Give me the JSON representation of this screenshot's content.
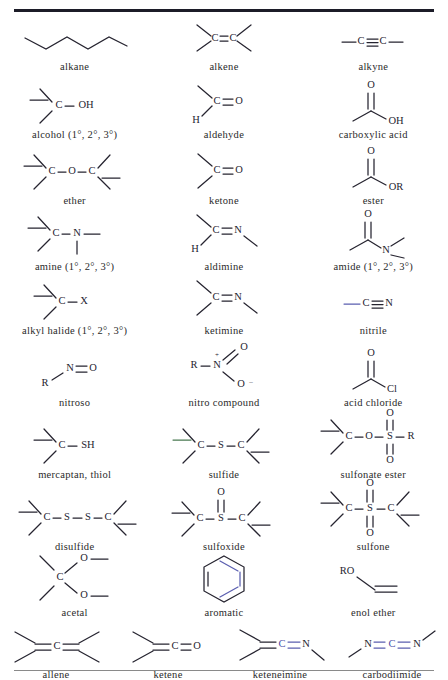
{
  "document": {
    "kind": "functional-groups-reference-table",
    "columns_per_row": [
      3,
      3,
      3,
      3,
      3,
      3,
      3,
      3,
      3,
      4
    ],
    "rules": {
      "top_rule_color": "#1c1c28",
      "bottom_rule_color": "#8a8a8a"
    },
    "accent_colors": {
      "blue_bond": "#5b5fb0",
      "green_bond": "#4a7a52",
      "text": "#262430"
    }
  },
  "rows": [
    {
      "cells": [
        {
          "name": "alkane",
          "label": "alkane",
          "formula": "C-C chain zigzag"
        },
        {
          "name": "alkene",
          "label": "alkene",
          "formula": "C=C"
        },
        {
          "name": "alkyne",
          "label": "alkyne",
          "formula": "-C≡C-"
        }
      ]
    },
    {
      "cells": [
        {
          "name": "alcohol",
          "label": "alcohol (1°, 2°, 3°)",
          "atoms": [
            "C",
            "OH"
          ]
        },
        {
          "name": "aldehyde",
          "label": "aldehyde",
          "atoms": [
            "C",
            "O",
            "H"
          ]
        },
        {
          "name": "carboxylic-acid",
          "label": "carboxylic acid",
          "atoms": [
            "O",
            "OH"
          ]
        }
      ]
    },
    {
      "cells": [
        {
          "name": "ether",
          "label": "ether",
          "atoms": [
            "C",
            "O",
            "C"
          ]
        },
        {
          "name": "ketone",
          "label": "ketone",
          "atoms": [
            "C",
            "O"
          ]
        },
        {
          "name": "ester",
          "label": "ester",
          "atoms": [
            "O",
            "OR"
          ]
        }
      ]
    },
    {
      "cells": [
        {
          "name": "amine",
          "label": "amine (1°, 2°, 3°)",
          "atoms": [
            "C",
            "N"
          ]
        },
        {
          "name": "aldimine",
          "label": "aldimine",
          "atoms": [
            "C",
            "N",
            "H"
          ]
        },
        {
          "name": "amide",
          "label": "amide (1°, 2°, 3°)",
          "atoms": [
            "O",
            "N"
          ]
        }
      ]
    },
    {
      "cells": [
        {
          "name": "alkyl-halide",
          "label": "alkyl halide (1°, 2°, 3°)",
          "atoms": [
            "C",
            "X"
          ]
        },
        {
          "name": "ketimine",
          "label": "ketimine",
          "atoms": [
            "C",
            "N"
          ]
        },
        {
          "name": "nitrile",
          "label": "nitrile",
          "atoms": [
            "C",
            "N"
          ],
          "bond_color": "blue"
        }
      ]
    },
    {
      "cells": [
        {
          "name": "nitroso",
          "label": "nitroso",
          "atoms": [
            "R",
            "N",
            "O"
          ]
        },
        {
          "name": "nitro-compound",
          "label": "nitro compound",
          "atoms": [
            "R",
            "N",
            "O",
            "O"
          ],
          "charges": [
            "+",
            "-"
          ]
        },
        {
          "name": "acid-chloride",
          "label": "acid chloride",
          "atoms": [
            "O",
            "Cl"
          ]
        }
      ]
    },
    {
      "cells": [
        {
          "name": "mercaptan-thiol",
          "label": "mercaptan, thiol",
          "atoms": [
            "C",
            "SH"
          ]
        },
        {
          "name": "sulfide",
          "label": "sulfide",
          "atoms": [
            "C",
            "S",
            "C"
          ],
          "bond_color": "green"
        },
        {
          "name": "sulfonate-ester",
          "label": "sulfonate ester",
          "atoms": [
            "C",
            "O",
            "S",
            "R",
            "O",
            "O"
          ]
        }
      ]
    },
    {
      "cells": [
        {
          "name": "disulfide",
          "label": "disulfide",
          "atoms": [
            "C",
            "S",
            "S",
            "C"
          ]
        },
        {
          "name": "sulfoxide",
          "label": "sulfoxide",
          "atoms": [
            "C",
            "S",
            "C",
            "O"
          ]
        },
        {
          "name": "sulfone",
          "label": "sulfone",
          "atoms": [
            "C",
            "S",
            "C",
            "O",
            "O"
          ]
        }
      ]
    },
    {
      "cells": [
        {
          "name": "acetal",
          "label": "acetal",
          "atoms": [
            "C",
            "O",
            "O"
          ]
        },
        {
          "name": "aromatic",
          "label": "aromatic",
          "formula": "benzene ring"
        },
        {
          "name": "enol-ether",
          "label": "enol ether",
          "atoms": [
            "RO"
          ]
        }
      ]
    },
    {
      "cells": [
        {
          "name": "allene",
          "label": "allene",
          "atoms": [
            "C"
          ]
        },
        {
          "name": "ketene",
          "label": "ketene",
          "atoms": [
            "C",
            "O"
          ]
        },
        {
          "name": "keteneimine",
          "label": "keteneimine",
          "atoms": [
            "C",
            "N"
          ],
          "bond_color": "blue"
        },
        {
          "name": "carbodiimide",
          "label": "carbodiimide",
          "atoms": [
            "N",
            "C",
            "N"
          ],
          "bond_color": "blue"
        }
      ]
    }
  ],
  "atom_labels": {
    "C": "C",
    "N": "N",
    "O": "O",
    "S": "S",
    "H": "H",
    "R": "R",
    "X": "X",
    "OH": "OH",
    "OR": "OR",
    "SH": "SH",
    "RO": "RO",
    "Cl": "Cl",
    "plus": "+",
    "minus": "–"
  }
}
